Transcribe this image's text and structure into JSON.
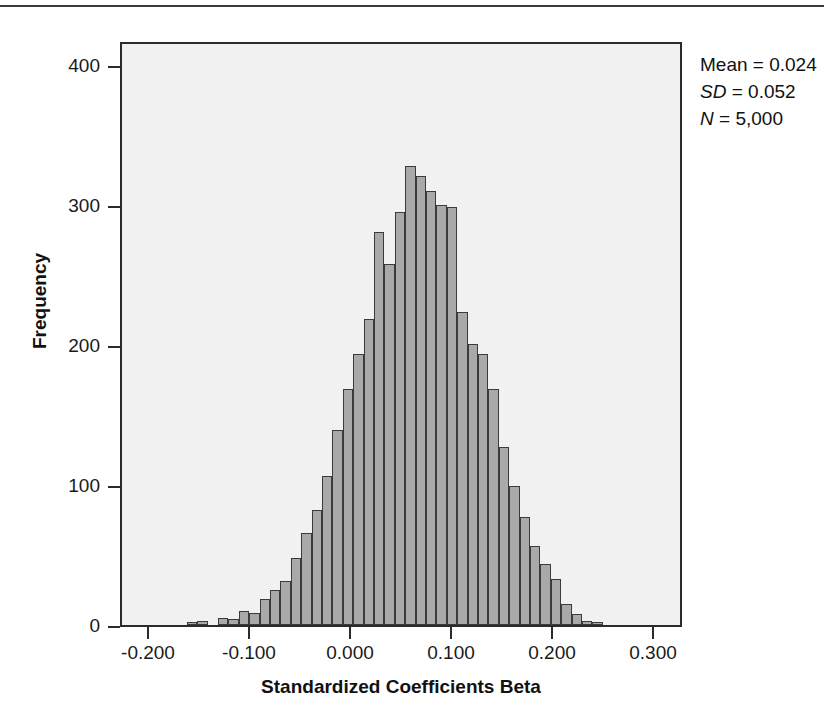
{
  "figure": {
    "axis_title_x": "Standardized Coefficients Beta",
    "axis_title_y": "Frequency"
  },
  "statistics": {
    "mean_label": "Mean",
    "mean_value": "0.024",
    "sd_label": "SD",
    "sd_value": "0.052",
    "n_label": "N",
    "n_value": "5,000",
    "mean_line": "Mean = 0.024",
    "sd_line": "SD = 0.052",
    "n_line": "N = 5,000"
  },
  "colors": {
    "bar_fill": "#a9a9a9",
    "bar_border": "#3b3b3b",
    "plot_background": "#f1f1f1",
    "axis": "#2b2b2b",
    "text": "#111111"
  },
  "chart_data": {
    "type": "bar",
    "title": "",
    "subtitle": "",
    "xlabel": "Standardized Coefficients Beta",
    "ylabel": "Frequency",
    "xlim": [
      -0.2495,
      0.3085
    ],
    "ylim": [
      0,
      418
    ],
    "grid": false,
    "legend": null,
    "x_tick_labels": [
      "-0.200",
      "-0.100",
      "0.000",
      "0.100",
      "0.200",
      "0.300"
    ],
    "x_tick_values": [
      -0.2,
      -0.1,
      0.0,
      0.1,
      0.2,
      0.3
    ],
    "y_tick_labels": [
      "0",
      "100",
      "200",
      "300",
      "400"
    ],
    "y_tick_values": [
      0,
      100,
      200,
      300,
      400
    ],
    "bin_width": 0.0104,
    "annotations": [
      "Mean = 0.024",
      "SD = 0.052",
      "N = 5,000"
    ],
    "bin_centers": [
      -0.1795,
      -0.1691,
      -0.1587,
      -0.1483,
      -0.1379,
      -0.1275,
      -0.1171,
      -0.1067,
      -0.0963,
      -0.0859,
      -0.0755,
      -0.0651,
      -0.0547,
      -0.0443,
      -0.0339,
      -0.0235,
      -0.0131,
      -0.0027,
      0.0077,
      0.0181,
      0.0285,
      0.0389,
      0.0493,
      0.0597,
      0.0701,
      0.0805,
      0.0909,
      0.1013,
      0.1117,
      0.1221,
      0.1325,
      0.1429,
      0.1533,
      0.1637,
      0.1741,
      0.1845,
      0.1949,
      0.2053,
      0.2157,
      0.2261
    ],
    "values": [
      2,
      3,
      0,
      5,
      4,
      10,
      9,
      19,
      25,
      32,
      48,
      66,
      83,
      107,
      140,
      170,
      195,
      220,
      283,
      260,
      297,
      330,
      323,
      312,
      302,
      301,
      225,
      202,
      195,
      170,
      128,
      100,
      78,
      57,
      44,
      33,
      15,
      8,
      3,
      2
    ]
  }
}
